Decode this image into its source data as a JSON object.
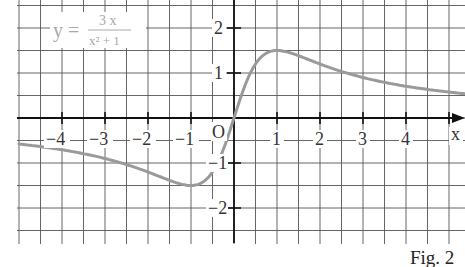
{
  "chart_data": {
    "type": "line",
    "title": "",
    "function_label": "y = 3x / (x² + 1)",
    "formula": {
      "lhs": "y =",
      "numerator": "3 x",
      "denominator": "x² + 1"
    },
    "xlabel": "x",
    "ylabel": "",
    "origin_label": "O",
    "x_ticks": [
      -4,
      -3,
      -2,
      -1,
      1,
      2,
      3,
      4
    ],
    "x_tick_labels": [
      "−4",
      "−3",
      "−2",
      "−1",
      "1",
      "2",
      "3",
      "4"
    ],
    "y_ticks": [
      2,
      1,
      -1,
      -2
    ],
    "y_tick_labels": [
      "2",
      "1",
      "−1",
      "−2"
    ],
    "xlim": [
      -5,
      5.3
    ],
    "ylim": [
      -2.8,
      2.6
    ],
    "grid": true,
    "grid_step": 0.5,
    "legend": null,
    "series": [
      {
        "name": "y = 3x/(x^2+1)",
        "color": "#9a9a9a",
        "x": [
          -5,
          -4,
          -3,
          -2,
          -1.5,
          -1,
          -0.5,
          0,
          0.5,
          1,
          1.5,
          2,
          3,
          4,
          5
        ],
        "y": [
          -0.58,
          -0.71,
          -0.9,
          -1.2,
          -1.38,
          -1.5,
          -1.2,
          0,
          1.2,
          1.5,
          1.38,
          1.2,
          0.9,
          0.71,
          0.58
        ]
      }
    ],
    "annotations": [
      "local maximum (1, 1.5)",
      "local minimum (-1, -1.5)"
    ]
  },
  "caption": "Fig. 2",
  "colors": {
    "curve": "#9a9a9a",
    "grid": "#555555",
    "axis": "#111111",
    "formula": "#a8a8a8"
  }
}
